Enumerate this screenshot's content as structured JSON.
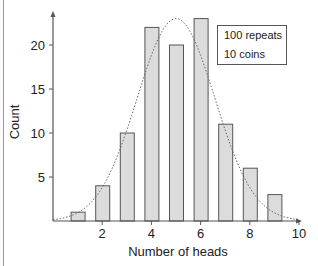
{
  "chart_data": {
    "type": "bar",
    "title": "",
    "xlabel": "Number of heads",
    "ylabel": "Count",
    "categories": [
      1,
      2,
      3,
      4,
      5,
      6,
      7,
      8,
      9
    ],
    "values": [
      1,
      4,
      10,
      22,
      20,
      23,
      11,
      6,
      3
    ],
    "x_ticks": [
      2,
      4,
      6,
      8,
      10
    ],
    "y_ticks": [
      5,
      10,
      15,
      20
    ],
    "xlim": [
      0,
      10
    ],
    "ylim": [
      0,
      25
    ],
    "grid": false,
    "overlay": {
      "type": "line",
      "style": "dotted",
      "description": "Fitted normal/binomial curve",
      "peak_x": 5,
      "peak_y": 23
    },
    "legend": {
      "position": "upper right",
      "entries": [
        "100 repeats",
        "10 coins"
      ]
    },
    "colors": {
      "bar_fill": "#dcdcdc",
      "bar_edge": "#555555",
      "axis": "#555555",
      "curve": "#666666"
    }
  },
  "legend": {
    "line1": "100 repeats",
    "line2": "10 coins"
  },
  "axes": {
    "xlabel": "Number of heads",
    "ylabel": "Count",
    "x_tick_labels": [
      "2",
      "4",
      "6",
      "8",
      "10"
    ],
    "y_tick_labels": [
      "5",
      "10",
      "15",
      "20"
    ]
  }
}
